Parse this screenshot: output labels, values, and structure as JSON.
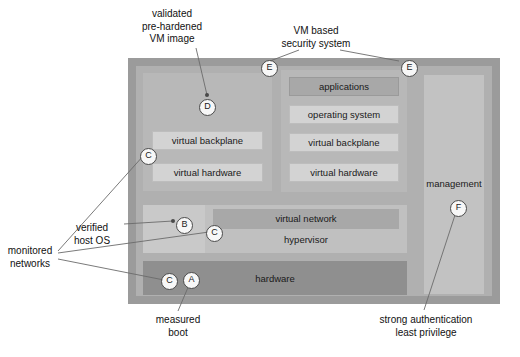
{
  "figure": {
    "colors": {
      "outer_frame": "#9b9b9b",
      "inner_canvas": "#b0b0b0",
      "vm_box": "#b8b8b8",
      "management": "#c2c2c2",
      "host_os": "#c9c9c9",
      "hypervisor": "#c0c0c0",
      "virtual_network": "#a8a8a8",
      "hardware": "#8f8f8f",
      "bar": "#d3d3d3",
      "bar_dark": "#a8a8a8",
      "leader_line": "#6b6b6b",
      "marker_fill": "#f7f7f7",
      "marker_stroke": "#4a4a4a",
      "text": "#111111",
      "background": "#ffffff"
    }
  },
  "blocks": {
    "vm_left": {
      "name": "left virtual machine",
      "bars": [
        {
          "label": "virtual backplane",
          "style": "light"
        },
        {
          "label": "virtual hardware",
          "style": "light"
        }
      ]
    },
    "vm_right": {
      "name": "right virtual machine",
      "bars": [
        {
          "label": "applications",
          "style": "dark"
        },
        {
          "label": "operating system",
          "style": "light"
        },
        {
          "label": "virtual backplane",
          "style": "light"
        },
        {
          "label": "virtual hardware",
          "style": "light"
        }
      ]
    },
    "management": {
      "label": "management"
    },
    "hypervisor": {
      "label": "hypervisor"
    },
    "virtual_network": {
      "label": "virtual network"
    },
    "hardware": {
      "label": "hardware"
    }
  },
  "markers": [
    {
      "id": "m-a-hardware",
      "letter": "A",
      "x": 183,
      "y": 272
    },
    {
      "id": "m-b-hostos",
      "letter": "B",
      "x": 176,
      "y": 217
    },
    {
      "id": "m-c-vmleft",
      "letter": "C",
      "x": 140,
      "y": 148
    },
    {
      "id": "m-c-hypervisor",
      "letter": "C",
      "x": 206,
      "y": 225
    },
    {
      "id": "m-c-hardware",
      "letter": "C",
      "x": 161,
      "y": 273
    },
    {
      "id": "m-d-vmleft",
      "letter": "D",
      "x": 199,
      "y": 99
    },
    {
      "id": "m-e-left",
      "letter": "E",
      "x": 261,
      "y": 60
    },
    {
      "id": "m-e-right",
      "letter": "E",
      "x": 401,
      "y": 60
    },
    {
      "id": "m-f-mgmt",
      "letter": "F",
      "x": 450,
      "y": 200
    }
  ],
  "annotations": [
    {
      "id": "annot-validated-vm-image",
      "lines": [
        "validated",
        "pre-hardened",
        "VM image"
      ],
      "x": 172,
      "y": 8,
      "align": "center"
    },
    {
      "id": "annot-vm-based-security-system",
      "lines": [
        "VM based",
        "security system"
      ],
      "x": 311,
      "y": 25,
      "align": "center"
    },
    {
      "id": "annot-verified-host-os",
      "lines": [
        "verified",
        "host OS"
      ],
      "x": 85,
      "y": 222,
      "align": "center"
    },
    {
      "id": "annot-monitored-networks",
      "lines": [
        "monitored",
        "networks"
      ],
      "x": 6,
      "y": 247,
      "align": "center"
    },
    {
      "id": "annot-measured-boot",
      "lines": [
        "measured",
        "boot"
      ],
      "x": 148,
      "y": 317,
      "align": "center"
    },
    {
      "id": "annot-strong-authentication",
      "lines": [
        "strong authentication",
        "least privilege"
      ],
      "x": 378,
      "y": 317,
      "align": "center"
    }
  ]
}
